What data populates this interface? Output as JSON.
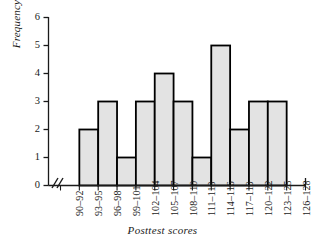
{
  "chart_data": {
    "type": "bar",
    "title": "",
    "subtitle": "",
    "xlabel": "Posttest scores",
    "ylabel": "Frequency",
    "categories": [
      "90–92",
      "93–95",
      "96–98",
      "99–101",
      "102–104",
      "105–107",
      "108–110",
      "111–113",
      "114–116",
      "117–119",
      "120–122",
      "123–125",
      "126–128"
    ],
    "values": [
      0,
      2,
      3,
      1,
      3,
      4,
      3,
      1,
      5,
      2,
      3,
      3,
      0
    ],
    "ylim": [
      0,
      6
    ],
    "yticks": [
      0,
      1,
      2,
      3,
      4,
      5,
      6
    ],
    "ytick_labels": [
      "0",
      "1",
      "2",
      "3",
      "4",
      "5",
      "6"
    ],
    "grid": false,
    "legend": null,
    "bar_fill": "#e3e3e3",
    "bar_edge": "#000000",
    "axis_color": "#1a1a1a",
    "axis_break": "//"
  }
}
